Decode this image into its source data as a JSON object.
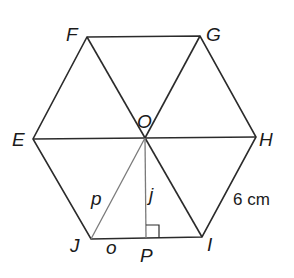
{
  "diagram": {
    "type": "regular hexagon divided into six equilateral triangles",
    "colors": {
      "outline": "#2b2b2b",
      "inner_segment": "#7a7a7a",
      "text": "#1a1a1a",
      "background": "#ffffff"
    },
    "vertices": {
      "F": {
        "label": "F",
        "x": 87,
        "y": 37
      },
      "G": {
        "label": "G",
        "x": 200,
        "y": 36
      },
      "H": {
        "label": "H",
        "x": 256,
        "y": 137
      },
      "I": {
        "label": "I",
        "x": 202,
        "y": 237
      },
      "J": {
        "label": "J",
        "x": 91,
        "y": 239
      },
      "E": {
        "label": "E",
        "x": 33,
        "y": 139
      },
      "O": {
        "label": "O",
        "x": 145,
        "y": 138
      },
      "P": {
        "label": "P",
        "x": 146,
        "y": 238
      }
    },
    "segment_labels": {
      "p": "p",
      "j": "j",
      "o": "o"
    },
    "measurement": "6 cm",
    "right_angle_at": "P"
  }
}
